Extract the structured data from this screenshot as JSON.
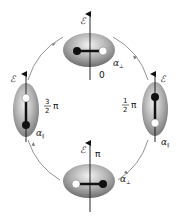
{
  "diagram": {
    "type": "cyclic polarizability ellipsoid diagram",
    "axis_label": "ℰ",
    "states": [
      {
        "id": "top",
        "phase": "0",
        "polarizability": "α",
        "polarizability_sub": "⊥",
        "orientation": "horizontal",
        "filled_dot": "left",
        "open_dot": "right"
      },
      {
        "id": "right",
        "phase_num": "1",
        "phase_den": "2",
        "phase_sym": "π",
        "polarizability": "α",
        "polarizability_sub": "∥",
        "orientation": "vertical",
        "filled_dot": "top",
        "open_dot": "bottom"
      },
      {
        "id": "bottom",
        "phase": "π",
        "polarizability": "α",
        "polarizability_sub": "⊥",
        "orientation": "horizontal",
        "filled_dot": "right",
        "open_dot": "left"
      },
      {
        "id": "left",
        "phase_num": "3",
        "phase_den": "2",
        "phase_sym": "π",
        "polarizability": "α",
        "polarizability_sub": "∥",
        "orientation": "vertical",
        "filled_dot": "bottom",
        "open_dot": "top"
      }
    ],
    "cycle_direction": "clockwise",
    "colors": {
      "ellipsoid_light": "#e6e6e6",
      "ellipsoid_dark": "#7a7a7a",
      "arc": "#666666",
      "axis": "#111111"
    }
  }
}
